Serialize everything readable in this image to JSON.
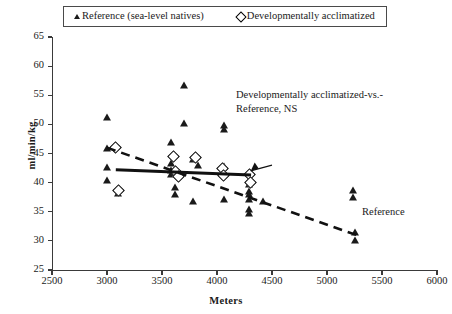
{
  "chart_data": {
    "type": "scatter",
    "title": "",
    "xlabel": "Meters",
    "ylabel": "ml/min/kg",
    "xlim": [
      2500,
      6000
    ],
    "ylim": [
      25,
      65
    ],
    "xticks": [
      2500,
      3000,
      3500,
      4000,
      4500,
      5000,
      5500,
      6000
    ],
    "yticks": [
      25,
      30,
      35,
      40,
      45,
      50,
      55,
      60,
      65
    ],
    "grid": false,
    "legend_position": "top-center",
    "series": [
      {
        "name": "Reference (sea-level natives)",
        "marker": "filled-triangle",
        "points": [
          [
            3000,
            51.2
          ],
          [
            3000,
            46.0
          ],
          [
            3000,
            42.6
          ],
          [
            3000,
            40.4
          ],
          [
            3100,
            38.3
          ],
          [
            3580,
            47.0
          ],
          [
            3580,
            43.4
          ],
          [
            3580,
            42.2
          ],
          [
            3580,
            41.4
          ],
          [
            3620,
            39.2
          ],
          [
            3620,
            38.0
          ],
          [
            3700,
            56.8
          ],
          [
            3700,
            50.2
          ],
          [
            3780,
            44.0
          ],
          [
            3780,
            36.9
          ],
          [
            3830,
            43.1
          ],
          [
            4060,
            49.9
          ],
          [
            4060,
            49.2
          ],
          [
            4060,
            42.8
          ],
          [
            4060,
            37.2
          ],
          [
            4290,
            39.8
          ],
          [
            4290,
            38.5
          ],
          [
            4290,
            38.0
          ],
          [
            4290,
            37.2
          ],
          [
            4290,
            35.4
          ],
          [
            4290,
            34.7
          ],
          [
            4420,
            36.9
          ],
          [
            5240,
            38.8
          ],
          [
            5240,
            37.6
          ],
          [
            5250,
            31.6
          ],
          [
            5250,
            30.2
          ]
        ]
      },
      {
        "name": "Developmentally acclimatized",
        "marker": "open-diamond",
        "points": [
          [
            3070,
            46.1
          ],
          [
            3100,
            38.7
          ],
          [
            3600,
            44.6
          ],
          [
            3620,
            41.9
          ],
          [
            3650,
            41.1
          ],
          [
            3800,
            44.3
          ],
          [
            4050,
            42.5
          ],
          [
            4060,
            41.2
          ],
          [
            4290,
            41.5
          ],
          [
            4300,
            40.1
          ]
        ]
      }
    ],
    "trendlines": [
      {
        "name": "Developmentally acclimatized",
        "style": "solid",
        "x0": 3080,
        "y0": 42.2,
        "x1": 4310,
        "y1": 41.3
      },
      {
        "name": "Reference",
        "style": "dashed",
        "x0": 3000,
        "y0": 46.0,
        "x1": 5300,
        "y1": 30.8
      }
    ],
    "annotations": [
      {
        "text_line1": "Developmentally acclimatized-vs.-",
        "text_line2": "Reference, NS",
        "arrow_from": [
          4500,
          43.0
        ],
        "arrow_to": [
          4270,
          41.5
        ]
      },
      {
        "text": "Reference",
        "at": [
          5620,
          35.6
        ]
      }
    ]
  },
  "legend": {
    "entries": [
      {
        "label": "Reference (sea-level natives)",
        "marker": "filled-triangle"
      },
      {
        "label": "Developmentally acclimatized",
        "marker": "open-diamond"
      }
    ]
  },
  "axes": {
    "y_title": "ml/min/kg",
    "x_title": "Meters",
    "y_labels": [
      "65",
      "60",
      "55",
      "50",
      "45",
      "40",
      "35",
      "30",
      "25"
    ],
    "x_labels": [
      "2500",
      "3000",
      "3500",
      "4000",
      "4500",
      "5000",
      "5500",
      "6000"
    ]
  },
  "annotation": {
    "line1": "Developmentally acclimatized-vs.-",
    "line2": "Reference, NS",
    "reference_label": "Reference"
  }
}
